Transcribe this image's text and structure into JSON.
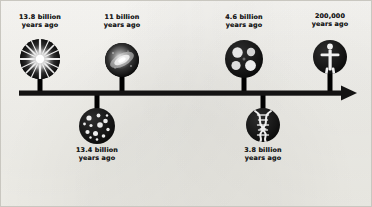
{
  "diagram": {
    "type": "horizontal-arrow-timeline",
    "background_color": "#f7f6f2",
    "ink_color": "#141313",
    "axis": {
      "name": "time-arrow",
      "direction": "left-to-right",
      "arrowhead": "right",
      "start_x": 18,
      "end_x": 352,
      "y": 92,
      "thickness": 5
    },
    "events": [
      {
        "id": "big-bang",
        "label": "13.8 billion\nyears ago",
        "icon": "big-bang-burst-icon",
        "side": "above",
        "x": 39,
        "label_top": 13,
        "disc_cx": 39,
        "disc_cy": 58,
        "disc_r": 20
      },
      {
        "id": "first-stars",
        "label": "13.4 billion\nyears ago",
        "icon": "star-cluster-icon",
        "side": "below",
        "x": 96,
        "label_top": 146,
        "disc_cx": 96,
        "disc_cy": 125,
        "disc_r": 18
      },
      {
        "id": "milky-way-galaxy",
        "label": "11 billion\nyears ago",
        "icon": "spiral-galaxy-icon",
        "side": "above",
        "x": 121,
        "label_top": 13,
        "disc_cx": 121,
        "disc_cy": 59,
        "disc_r": 17
      },
      {
        "id": "solar-system",
        "label": "4.6 billion\nyears ago",
        "icon": "solar-system-icon",
        "side": "above",
        "x": 243,
        "label_top": 13,
        "disc_cx": 243,
        "disc_cy": 58,
        "disc_r": 19
      },
      {
        "id": "origin-of-life",
        "label": "3.8 billion\nyears ago",
        "icon": "dna-helix-icon",
        "side": "below",
        "x": 262,
        "label_top": 146,
        "disc_cx": 262,
        "disc_cy": 124,
        "disc_r": 17
      },
      {
        "id": "modern-humans",
        "label": "200,000\nyears ago",
        "icon": "human-figure-icon",
        "side": "above",
        "x": 329,
        "label_top": 12,
        "disc_cx": 329,
        "disc_cy": 56,
        "disc_r": 17
      }
    ]
  }
}
